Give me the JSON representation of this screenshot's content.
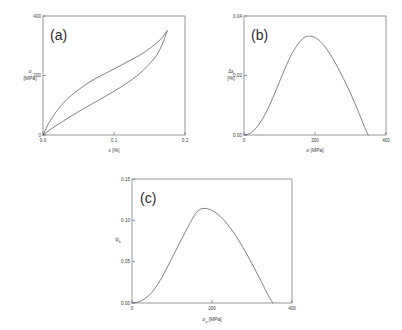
{
  "figure": {
    "background_color": "#ffffff",
    "curve_color": "#4a4a4a",
    "axis_color": "#6b6b6b"
  },
  "panels": {
    "a": {
      "tag": "(a)",
      "xlabel": "ε [%]",
      "ylabel_line1": "σ",
      "ylabel_line2": "[MPa]",
      "xticks": [
        "0.0",
        "0.1",
        "0.2"
      ],
      "yticks": [
        "0",
        "200",
        "400"
      ]
    },
    "b": {
      "tag": "(b)",
      "xlabel": "σ [MPa]",
      "ylabel_line1": "Δε",
      "ylabel_line2": "[%]",
      "xticks": [
        "0",
        "200",
        "400"
      ],
      "yticks": [
        "0.00",
        "0.02",
        "0.04"
      ]
    },
    "c": {
      "tag": "(c)",
      "xlabel_main": "σ",
      "xlabel_sub": "a",
      "xlabel_unit": " [MPa]",
      "ylabel": "ψ",
      "ylabel_sub": "b",
      "xticks": [
        "0",
        "200",
        "400"
      ],
      "yticks": [
        "0.00",
        "0.05",
        "0.10",
        "0.15"
      ]
    }
  },
  "chart_data": [
    {
      "type": "line",
      "panel": "a",
      "title": "(a)",
      "xlabel": "ε [%]",
      "ylabel": "σ [MPa]",
      "xlim": [
        0,
        0.2
      ],
      "ylim": [
        0,
        400
      ],
      "xticks": [
        0,
        0.1,
        0.2
      ],
      "yticks": [
        0,
        200,
        400
      ],
      "grid": false,
      "legend": "none",
      "annotation": "Stress-strain hysteresis loop; loading and unloading branches meet at origin and at the loop tip (0.175, 350).",
      "series": [
        {
          "name": "loading branch (upper)",
          "x": [
            0,
            0.006,
            0.014,
            0.024,
            0.036,
            0.05,
            0.065,
            0.082,
            0.1,
            0.118,
            0.136,
            0.152,
            0.165,
            0.175
          ],
          "y": [
            0,
            30,
            62,
            95,
            125,
            152,
            177,
            200,
            222,
            245,
            268,
            294,
            320,
            350
          ]
        },
        {
          "name": "unloading branch (lower)",
          "x": [
            0,
            0.01,
            0.024,
            0.042,
            0.062,
            0.082,
            0.1,
            0.118,
            0.134,
            0.148,
            0.16,
            0.168,
            0.175
          ],
          "y": [
            0,
            18,
            40,
            67,
            95,
            122,
            147,
            174,
            202,
            234,
            268,
            305,
            350
          ]
        }
      ]
    },
    {
      "type": "line",
      "panel": "b",
      "title": "(b)",
      "xlabel": "σ [MPa]",
      "ylabel": "Δε [%]",
      "xlim": [
        0,
        400
      ],
      "ylim": [
        0,
        0.04
      ],
      "xticks": [
        0,
        200,
        400
      ],
      "yticks": [
        0,
        0.02,
        0.04
      ],
      "grid": false,
      "legend": "none",
      "annotation": "Strain amplitude difference peaks near σ = 175 MPa at Δε ≈ 0.033 % and returns to zero near σ = 350 MPa.",
      "x": [
        0,
        15,
        30,
        50,
        70,
        90,
        110,
        130,
        150,
        170,
        185,
        200,
        220,
        240,
        260,
        280,
        300,
        320,
        335,
        345,
        350
      ],
      "y": [
        0.0,
        0.0005,
        0.0018,
        0.005,
        0.0095,
        0.015,
        0.0208,
        0.0262,
        0.0302,
        0.0328,
        0.0332,
        0.0328,
        0.0308,
        0.0276,
        0.0236,
        0.019,
        0.014,
        0.0085,
        0.004,
        0.0012,
        0.0
      ]
    },
    {
      "type": "line",
      "panel": "c",
      "title": "(c)",
      "xlabel": "σ_a [MPa]",
      "ylabel": "ψ_b",
      "xlim": [
        0,
        400
      ],
      "ylim": [
        0,
        0.15
      ],
      "xticks": [
        0,
        200,
        400
      ],
      "yticks": [
        0,
        0.05,
        0.1,
        0.15
      ],
      "grid": false,
      "legend": "none",
      "annotation": "Damping function peaks at ψ_b ≈ 0.115 near σ_a = 170 MPa and falls to zero near σ_a = 350 MPa.",
      "x": [
        0,
        15,
        30,
        50,
        70,
        90,
        110,
        130,
        150,
        165,
        180,
        200,
        220,
        240,
        260,
        280,
        300,
        320,
        335,
        345,
        352
      ],
      "y": [
        0.0,
        0.0012,
        0.0045,
        0.013,
        0.027,
        0.045,
        0.064,
        0.083,
        0.101,
        0.1115,
        0.1145,
        0.112,
        0.105,
        0.0945,
        0.081,
        0.065,
        0.0475,
        0.029,
        0.0145,
        0.0055,
        0.0
      ]
    }
  ]
}
